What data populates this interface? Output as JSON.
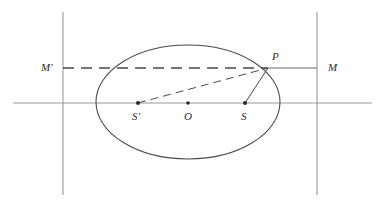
{
  "figure": {
    "caption": "",
    "width": 385,
    "height": 202,
    "background_color": "#ffffff",
    "stroke_color": "#4a4a4a",
    "axis_color": "#9a9a9a",
    "directrix_color": "#8f8f8f",
    "label_color": "#2b2b2b"
  },
  "labels": {
    "directrix_left": "M′",
    "directrix_right": "M",
    "point_on_ellipse": "P",
    "focus_left": "S′",
    "centre": "O",
    "focus_right": "S"
  },
  "geometry": {
    "ellipse": {
      "cx": 188,
      "cy": 102,
      "rx": 92,
      "ry": 57
    },
    "major_axis_line": {
      "x1": 13,
      "y1": 103,
      "x2": 372,
      "y2": 103
    },
    "directrix_left_line": {
      "x": 63,
      "y1": 12,
      "y2": 195
    },
    "directrix_right_line": {
      "x": 317,
      "y1": 12,
      "y2": 195
    },
    "horizontal_through_p_dashed": {
      "x1": 63,
      "y1": 68,
      "x2": 268,
      "y2": 68
    },
    "horizontal_through_p_solid": {
      "x1": 268,
      "y1": 68,
      "x2": 317,
      "y2": 68
    },
    "focal_radius_left_dashed": {
      "x1": 138,
      "y1": 103,
      "x2": 268,
      "y2": 68
    },
    "focal_radius_right_solid": {
      "x1": 245,
      "y1": 103,
      "x2": 268,
      "y2": 68
    },
    "points": {
      "focus_left": {
        "x": 138,
        "y": 103
      },
      "centre": {
        "x": 188,
        "y": 103
      },
      "focus_right": {
        "x": 245,
        "y": 103
      },
      "point_p": {
        "x": 268,
        "y": 68
      }
    },
    "label_positions": {
      "directrix_left": {
        "x": 41,
        "y": 62
      },
      "directrix_right": {
        "x": 328,
        "y": 62
      },
      "point_on_ellipse": {
        "x": 272,
        "y": 51
      },
      "focus_left": {
        "x": 132,
        "y": 111
      },
      "centre": {
        "x": 184,
        "y": 111
      },
      "focus_right": {
        "x": 241,
        "y": 111
      }
    }
  }
}
